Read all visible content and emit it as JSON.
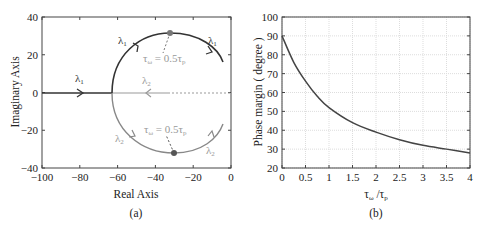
{
  "chart_data": [
    {
      "type": "line",
      "panel_label": "(a)",
      "title": "",
      "xlabel": "Real Axis",
      "ylabel": "Imaginary Axis",
      "xlim": [
        -100,
        0
      ],
      "ylim": [
        -40,
        40
      ],
      "xticks": [
        "-100",
        "-80",
        "-60",
        "-40",
        "-20",
        "0"
      ],
      "yticks": [
        "40",
        "20",
        "0",
        "-20",
        "-40"
      ],
      "grid": false,
      "series": [
        {
          "name": "λ1",
          "color": "#333333",
          "description": "real-axis branch then upper arc",
          "points": [
            [
              -100,
              0
            ],
            [
              -62,
              0
            ],
            [
              -60,
              13
            ],
            [
              -53,
              24
            ],
            [
              -42,
              30
            ],
            [
              -31,
              31.5
            ],
            [
              -20,
              29
            ],
            [
              -10,
              23
            ],
            [
              -3,
              15
            ]
          ]
        },
        {
          "name": "λ2",
          "color": "#888888",
          "description": "real-axis branch (dotted near origin) then lower arc",
          "points": [
            [
              -3,
              0
            ],
            [
              -62,
              0
            ],
            [
              -60,
              -13
            ],
            [
              -53,
              -24
            ],
            [
              -42,
              -30
            ],
            [
              -30,
              -32
            ],
            [
              -20,
              -29
            ],
            [
              -10,
              -23
            ],
            [
              -3,
              -15
            ]
          ]
        }
      ],
      "annotations": [
        {
          "text": "λ1",
          "x": -78,
          "y": 5
        },
        {
          "text": "λ1",
          "x": -54,
          "y": 27
        },
        {
          "text": "λ1",
          "x": -8,
          "y": 27
        },
        {
          "text": "λ2",
          "x": -44,
          "y": 5
        },
        {
          "text": "λ2",
          "x": -56,
          "y": -23
        },
        {
          "text": "λ2",
          "x": -10,
          "y": -31
        },
        {
          "text": "τω = 0.5τp",
          "x": -30,
          "y": 20,
          "marker": [
            -31,
            31.5
          ]
        },
        {
          "text": "τω = 0.5τp",
          "x": -28,
          "y": -20,
          "marker": [
            -30,
            -32
          ]
        }
      ]
    },
    {
      "type": "line",
      "panel_label": "(b)",
      "title": "",
      "xlabel": "τω /τp",
      "ylabel": "Phase margin ( degree )",
      "xlim": [
        0,
        4
      ],
      "ylim": [
        20,
        100
      ],
      "xticks": [
        "0",
        "0.5",
        "1",
        "1.5",
        "2",
        "2.5",
        "3",
        "3.5",
        "4"
      ],
      "yticks": [
        "100",
        "90",
        "80",
        "70",
        "60",
        "50",
        "40",
        "30",
        "20"
      ],
      "grid": true,
      "x": [
        0,
        0.25,
        0.5,
        0.75,
        1,
        1.5,
        2,
        2.5,
        3,
        3.5,
        4
      ],
      "series": [
        {
          "name": "Phase margin",
          "color": "#444444",
          "values": [
            90,
            76,
            66,
            58,
            52,
            44,
            39,
            35,
            32,
            30,
            28
          ]
        }
      ]
    }
  ],
  "labels": {
    "a": {
      "xlabel": "Real Axis",
      "ylabel": "Imaginary Axis",
      "panel": "(a)",
      "l1": "λ",
      "l2": "λ",
      "sub1": "1",
      "sub2": "2",
      "ann_lhs": "τ",
      "ann_sub": "ω",
      "ann_mid": " = 0.5τ",
      "ann_sub2": "p"
    },
    "b": {
      "xlabel_t1": "τ",
      "xlabel_s1": "ω",
      "xlabel_slash": " /τ",
      "xlabel_s2": "p",
      "ylabel": "Phase margin ( degree )",
      "panel": "(b)"
    }
  }
}
